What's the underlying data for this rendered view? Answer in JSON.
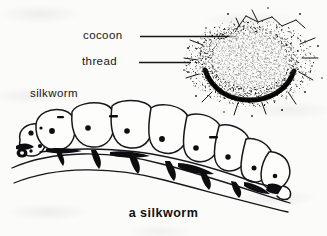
{
  "figure": {
    "caption": "a silkworm",
    "background_color": "#fbfbf9",
    "ink_color": "#16161a",
    "labels": {
      "cocoon": "cocoon",
      "thread": "thread",
      "silkworm": "silkworm"
    },
    "leader_lines": [
      {
        "name": "cocoon-leader",
        "x1": 140,
        "y1": 37,
        "x2": 236,
        "y2": 37
      },
      {
        "name": "thread-leader",
        "x1": 139,
        "y1": 63,
        "x2": 191,
        "y2": 63
      }
    ],
    "parts": [
      {
        "name": "cocoon",
        "description": "stippled oval silk mass with radiating thread wisps"
      },
      {
        "name": "thread",
        "description": "silk fibre strands around the cocoon"
      },
      {
        "name": "silkworm",
        "description": "segmented caterpillar larva resting on a twig"
      },
      {
        "name": "twig",
        "description": "two curved branch lines beneath the larva"
      }
    ]
  }
}
